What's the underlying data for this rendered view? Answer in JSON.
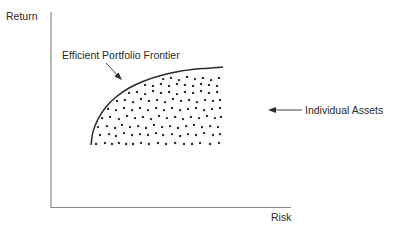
{
  "chart_data": {
    "type": "scatter",
    "title": "",
    "xlabel": "Risk",
    "ylabel": "Return",
    "xlim": [
      0,
      100
    ],
    "ylim": [
      0,
      100
    ],
    "grid": false,
    "legend": "none",
    "ticks": {
      "x": [],
      "y": []
    },
    "annotations": [
      {
        "text": "Efficient Portfolio Frontier",
        "target": "frontier_curve",
        "arrow": true
      },
      {
        "text": "Individual Assets",
        "target": "scatter_points",
        "arrow": true
      }
    ],
    "series": [
      {
        "name": "Efficient Portfolio Frontier",
        "kind": "curve",
        "points": [
          [
            16.7,
            31.8
          ],
          [
            17.5,
            38.5
          ],
          [
            19.6,
            45.1
          ],
          [
            22.9,
            51.3
          ],
          [
            27.1,
            56.4
          ],
          [
            32.5,
            61.0
          ],
          [
            38.8,
            64.6
          ],
          [
            45.8,
            67.4
          ],
          [
            54.2,
            69.7
          ],
          [
            63.3,
            71.0
          ],
          [
            71.7,
            71.8
          ]
        ]
      },
      {
        "name": "Individual Assets",
        "kind": "points",
        "points": [
          [
            18.8,
            32.3
          ],
          [
            22.5,
            32.8
          ],
          [
            25.4,
            32.3
          ],
          [
            28.3,
            32.8
          ],
          [
            31.3,
            32.3
          ],
          [
            34.2,
            32.3
          ],
          [
            37.5,
            32.8
          ],
          [
            40.8,
            32.3
          ],
          [
            44.6,
            32.8
          ],
          [
            47.9,
            32.3
          ],
          [
            51.7,
            32.8
          ],
          [
            55.4,
            32.3
          ],
          [
            58.8,
            32.3
          ],
          [
            62.1,
            32.8
          ],
          [
            66.3,
            32.3
          ],
          [
            70.0,
            32.8
          ],
          [
            20.4,
            36.9
          ],
          [
            24.2,
            37.4
          ],
          [
            27.1,
            36.4
          ],
          [
            30.4,
            37.9
          ],
          [
            33.8,
            36.9
          ],
          [
            37.1,
            37.4
          ],
          [
            40.4,
            36.9
          ],
          [
            43.8,
            37.9
          ],
          [
            46.7,
            36.9
          ],
          [
            50.4,
            37.4
          ],
          [
            53.8,
            36.4
          ],
          [
            57.1,
            37.4
          ],
          [
            60.4,
            36.9
          ],
          [
            63.8,
            37.9
          ],
          [
            67.5,
            36.9
          ],
          [
            70.4,
            37.4
          ],
          [
            19.6,
            41.0
          ],
          [
            23.3,
            41.5
          ],
          [
            26.7,
            40.5
          ],
          [
            29.6,
            42.1
          ],
          [
            32.9,
            41.0
          ],
          [
            36.3,
            41.5
          ],
          [
            39.6,
            40.5
          ],
          [
            42.9,
            42.1
          ],
          [
            46.3,
            41.0
          ],
          [
            49.6,
            41.5
          ],
          [
            52.9,
            40.5
          ],
          [
            56.3,
            41.5
          ],
          [
            59.6,
            42.1
          ],
          [
            62.9,
            41.0
          ],
          [
            66.3,
            41.5
          ],
          [
            69.6,
            41.0
          ],
          [
            21.3,
            45.6
          ],
          [
            24.6,
            46.2
          ],
          [
            28.3,
            45.1
          ],
          [
            31.7,
            46.7
          ],
          [
            35.0,
            45.6
          ],
          [
            38.3,
            46.2
          ],
          [
            41.7,
            45.1
          ],
          [
            45.0,
            46.7
          ],
          [
            48.3,
            45.6
          ],
          [
            51.7,
            46.2
          ],
          [
            55.0,
            45.1
          ],
          [
            58.3,
            46.2
          ],
          [
            61.7,
            45.6
          ],
          [
            65.0,
            46.7
          ],
          [
            68.3,
            45.6
          ],
          [
            70.8,
            46.2
          ],
          [
            23.8,
            50.3
          ],
          [
            27.1,
            49.7
          ],
          [
            30.4,
            50.8
          ],
          [
            33.8,
            49.7
          ],
          [
            37.1,
            50.8
          ],
          [
            40.4,
            49.7
          ],
          [
            43.8,
            50.8
          ],
          [
            47.1,
            49.7
          ],
          [
            50.4,
            50.8
          ],
          [
            53.8,
            49.7
          ],
          [
            57.1,
            50.3
          ],
          [
            60.4,
            50.8
          ],
          [
            63.8,
            49.7
          ],
          [
            67.1,
            50.3
          ],
          [
            70.4,
            50.8
          ],
          [
            27.5,
            54.4
          ],
          [
            30.8,
            54.9
          ],
          [
            34.2,
            53.8
          ],
          [
            37.5,
            55.4
          ],
          [
            40.8,
            54.4
          ],
          [
            44.2,
            54.9
          ],
          [
            47.5,
            53.8
          ],
          [
            50.8,
            55.4
          ],
          [
            54.2,
            54.4
          ],
          [
            57.5,
            54.9
          ],
          [
            60.8,
            53.8
          ],
          [
            64.2,
            54.9
          ],
          [
            67.5,
            54.4
          ],
          [
            70.4,
            54.9
          ],
          [
            32.5,
            58.5
          ],
          [
            35.8,
            59.0
          ],
          [
            39.2,
            57.9
          ],
          [
            42.5,
            59.5
          ],
          [
            45.8,
            58.5
          ],
          [
            49.2,
            59.0
          ],
          [
            52.5,
            57.9
          ],
          [
            55.8,
            59.0
          ],
          [
            59.2,
            58.5
          ],
          [
            62.5,
            59.5
          ],
          [
            65.8,
            58.5
          ],
          [
            69.2,
            59.0
          ],
          [
            39.2,
            62.6
          ],
          [
            42.5,
            62.1
          ],
          [
            45.8,
            63.1
          ],
          [
            49.2,
            62.1
          ],
          [
            52.5,
            63.1
          ],
          [
            55.8,
            62.6
          ],
          [
            59.2,
            62.1
          ],
          [
            62.5,
            63.1
          ],
          [
            65.8,
            62.6
          ],
          [
            69.2,
            62.1
          ],
          [
            46.7,
            65.6
          ],
          [
            50.0,
            66.2
          ],
          [
            53.3,
            65.1
          ],
          [
            56.7,
            66.7
          ],
          [
            60.0,
            65.6
          ],
          [
            63.3,
            66.2
          ],
          [
            66.7,
            65.1
          ],
          [
            70.0,
            66.2
          ]
        ]
      }
    ]
  },
  "labels": {
    "y_axis": "Return",
    "x_axis": "Risk",
    "frontier": "Efficient Portfolio Frontier",
    "assets": "Individual Assets"
  },
  "colors": {
    "axis": "#8a8a8a",
    "curve": "#2a2a2a",
    "dots": "#2a2a2a",
    "text": "#2a2a2a",
    "background": "#ffffff"
  }
}
